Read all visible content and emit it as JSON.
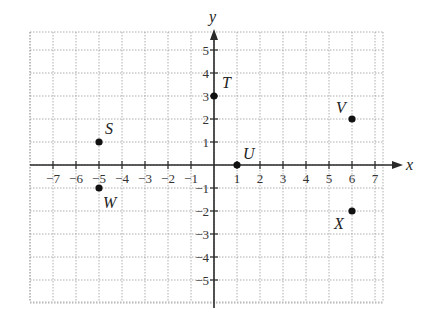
{
  "chart_data": {
    "type": "scatter",
    "title": "",
    "xlabel": "x",
    "ylabel": "y",
    "xlim": [
      -8,
      7.5
    ],
    "ylim": [
      -5.8,
      5.8
    ],
    "grid": true,
    "x_ticks": [
      -7,
      -6,
      -5,
      -4,
      -3,
      -2,
      -1,
      1,
      2,
      3,
      4,
      5,
      6,
      7
    ],
    "y_ticks": [
      -5,
      -4,
      -3,
      -2,
      -1,
      1,
      2,
      3,
      4,
      5
    ],
    "points": [
      {
        "label": "S",
        "x": -5,
        "y": 1
      },
      {
        "label": "T",
        "x": 0,
        "y": 3
      },
      {
        "label": "U",
        "x": 1,
        "y": 0
      },
      {
        "label": "V",
        "x": 6,
        "y": 2
      },
      {
        "label": "W",
        "x": -5,
        "y": -1
      },
      {
        "label": "X",
        "x": 6,
        "y": -2
      }
    ]
  },
  "layout": {
    "origin_px": [
      214,
      165
    ],
    "unit_px": 23,
    "grid_left": 30,
    "grid_right": 383,
    "grid_top": 32,
    "grid_bottom": 302,
    "label_offsets": {
      "S": [
        6,
        -8
      ],
      "T": [
        8,
        -8
      ],
      "U": [
        6,
        -6
      ],
      "V": [
        -16,
        -6
      ],
      "W": [
        4,
        20
      ],
      "X": [
        -18,
        18
      ]
    }
  },
  "colors": {
    "axis": "#2a2a2a",
    "grid": "#9a9a9a",
    "point": "#111111"
  }
}
